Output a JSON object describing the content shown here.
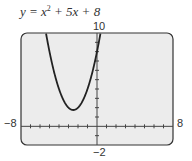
{
  "chart_data": {
    "type": "line",
    "function": "x^2 + 5x + 8",
    "xlabel": "",
    "ylabel": "",
    "xlim": [
      -8,
      8
    ],
    "ylim": [
      -2,
      10
    ],
    "x_tick_step": 1,
    "y_tick_step": 1,
    "grid": false,
    "window_labels": {
      "xmin": "-8",
      "xmax": "8",
      "ymin": "-2",
      "ymax": "10"
    },
    "series": [
      {
        "name": "y = x^2 + 5x + 8",
        "x": [
          -5.5,
          -5,
          -4,
          -3,
          -2.5,
          -2,
          -1,
          0,
          0.2
        ],
        "y": [
          10.75,
          8,
          4,
          2,
          1.75,
          2,
          4,
          8,
          9.04
        ]
      }
    ],
    "vertex": {
      "x": -2.5,
      "y": 1.75
    }
  },
  "labels": {
    "title_prefix": "y = x",
    "title_exp": "2",
    "title_suffix": " + 5x + 8",
    "ymax": "10",
    "ymin": "−2",
    "xmin": "−8",
    "xmax": "8"
  }
}
